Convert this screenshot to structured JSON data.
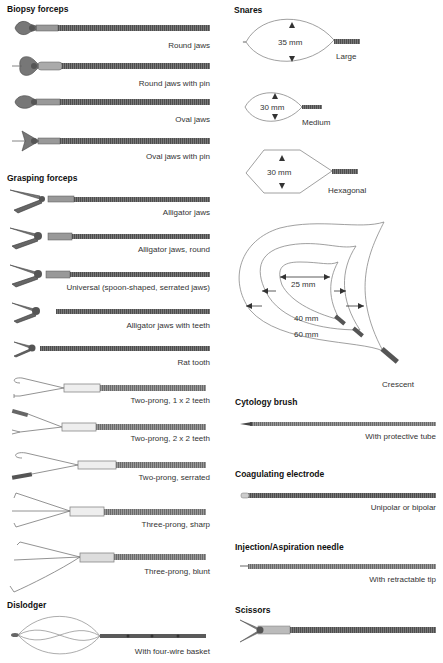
{
  "left_column": {
    "biopsy_forceps": {
      "heading": "Biopsy forceps",
      "items": [
        {
          "label": "Round jaws"
        },
        {
          "label": "Round jaws with pin"
        },
        {
          "label": "Oval jaws"
        },
        {
          "label": "Oval jaws with pin"
        }
      ]
    },
    "grasping_forceps": {
      "heading": "Grasping forceps",
      "items": [
        {
          "label": "Alligator jaws"
        },
        {
          "label": "Alligator jaws, round"
        },
        {
          "label": "Universal (spoon-shaped, serrated jaws)"
        },
        {
          "label": "Alligator jaws with teeth"
        },
        {
          "label": "Rat tooth"
        },
        {
          "label": "Two-prong, 1 x 2 teeth"
        },
        {
          "label": "Two-prong, 2 x 2 teeth"
        },
        {
          "label": "Two-prong, serrated"
        },
        {
          "label": "Three-prong, sharp"
        },
        {
          "label": "Three-prong, blunt"
        }
      ]
    },
    "dislodger": {
      "heading": "Dislodger",
      "items": [
        {
          "label": "With four-wire basket"
        }
      ]
    }
  },
  "right_column": {
    "snares": {
      "heading": "Snares",
      "items": [
        {
          "label": "Large",
          "dimension": "35 mm"
        },
        {
          "label": "Medium",
          "dimension": "30 mm"
        },
        {
          "label": "Hexagonal",
          "dimension": "30 mm"
        },
        {
          "label": "Crescent",
          "dimensions": [
            "25 mm",
            "40 mm",
            "60 mm"
          ]
        }
      ]
    },
    "cytology_brush": {
      "heading": "Cytology brush",
      "items": [
        {
          "label": "With protective tube"
        }
      ]
    },
    "coagulating_electrode": {
      "heading": "Coagulating electrode",
      "items": [
        {
          "label": "Unipolar or bipolar"
        }
      ]
    },
    "injection_needle": {
      "heading": "Injection/Aspiration needle",
      "items": [
        {
          "label": "With retractable tip"
        }
      ]
    },
    "scissors": {
      "heading": "Scissors",
      "items": []
    }
  },
  "colors": {
    "shaft": "#6b6b6b",
    "shaft_dark": "#4a4a4a",
    "outline": "#777777",
    "text": "#333333"
  }
}
